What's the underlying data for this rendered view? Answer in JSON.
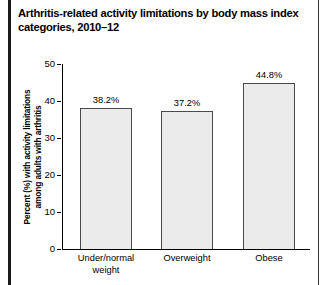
{
  "figure": {
    "title_lines": [
      "Arthritis-related activity limitations by body mass index",
      "categories, 2010–12"
    ]
  },
  "chart_data": {
    "type": "bar",
    "title": "Arthritis-related activity limitations by body mass index categories, 2010–12",
    "categories": [
      "Under/normal weight",
      "Overweight",
      "Obese"
    ],
    "category_label_lines": [
      [
        "Under/normal",
        "weight"
      ],
      [
        "Overweight"
      ],
      [
        "Obese"
      ]
    ],
    "values": [
      38.2,
      37.2,
      44.8
    ],
    "value_labels": [
      "38.2%",
      "37.2%",
      "44.8%"
    ],
    "xlabel": "",
    "ylabel": "Percent (%) with activity limitations among adults with arthritis",
    "ylabel_lines": [
      "Percent (%) with activity limitations",
      "among adults with arthritis"
    ],
    "ylim": [
      0,
      50
    ],
    "yticks": [
      0,
      10,
      20,
      30,
      40,
      50
    ],
    "ytick_labels": [
      "0",
      "10",
      "20",
      "30",
      "40",
      "50"
    ],
    "grid": false,
    "legend": null,
    "bar_fill_color": "#ebebeb",
    "bar_edge_color": "#4a4a4a",
    "axis_color": "#000000",
    "background_color": "#ffffff"
  }
}
